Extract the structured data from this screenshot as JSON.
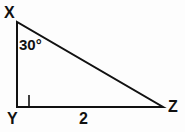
{
  "figure": {
    "kind": "right-triangle-diagram",
    "background_color": "#fdfdfd",
    "stroke_color": "#111111",
    "stroke_width": 2,
    "vertices": {
      "x": {
        "label": "X",
        "px": [
          17,
          22
        ]
      },
      "y": {
        "label": "Y",
        "px": [
          17,
          107
        ]
      },
      "z": {
        "label": "Z",
        "px": [
          163,
          107
        ]
      }
    },
    "angles": {
      "at_x": {
        "label": "30°",
        "value": 30,
        "unit": "degrees"
      },
      "at_y": {
        "label": "",
        "value": 90,
        "unit": "degrees",
        "marker": "right-angle-square"
      }
    },
    "sides": {
      "yz": {
        "label": "2",
        "value": 2
      },
      "xy": {
        "label": ""
      },
      "xz": {
        "label": ""
      }
    }
  }
}
